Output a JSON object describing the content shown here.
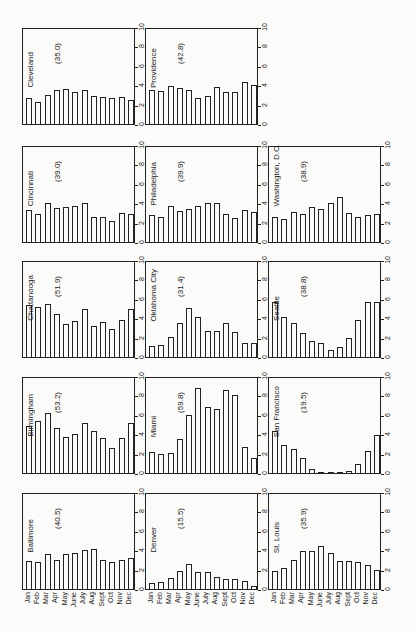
{
  "chart_data": {
    "type": "bar",
    "categories": [
      "Jan",
      "Feb",
      "Mar",
      "Apr",
      "May",
      "June",
      "July",
      "Aug",
      "Sept",
      "Oct",
      "Nov",
      "Dec"
    ],
    "ylim": [
      0,
      10
    ],
    "yticks": [
      0,
      2,
      4,
      6,
      8,
      10
    ],
    "grid": false,
    "layout": "3 columns x 5 rows small multiples; month labels only under bottom row",
    "panels": [
      {
        "city": "Cleveland",
        "total": "(35.0)",
        "row": 0,
        "col": 0,
        "values": [
          2.7,
          2.3,
          3.1,
          3.6,
          3.7,
          3.4,
          3.6,
          3.0,
          2.8,
          2.7,
          2.8,
          2.5
        ]
      },
      {
        "city": "Providence",
        "total": "(42.8)",
        "row": 0,
        "col": 1,
        "values": [
          3.6,
          3.5,
          4.0,
          3.8,
          3.6,
          2.7,
          2.9,
          3.9,
          3.4,
          3.4,
          4.4,
          4.1
        ]
      },
      {
        "city": "Cincinnati",
        "total": "(39.0)",
        "row": 1,
        "col": 0,
        "values": [
          3.4,
          3.0,
          4.1,
          3.6,
          3.7,
          3.8,
          4.1,
          2.6,
          2.6,
          2.2,
          3.1,
          2.9
        ]
      },
      {
        "city": "Philadelphia",
        "total": "(39.9)",
        "row": 1,
        "col": 1,
        "values": [
          2.8,
          2.6,
          3.8,
          3.3,
          3.5,
          3.8,
          4.1,
          4.1,
          3.0,
          2.5,
          3.4,
          3.2
        ]
      },
      {
        "city": "Washington, D.C.",
        "total": "(38.9)",
        "row": 1,
        "col": 2,
        "values": [
          2.6,
          2.4,
          3.2,
          2.9,
          3.7,
          3.5,
          4.1,
          4.7,
          3.1,
          2.6,
          2.8,
          2.9
        ]
      },
      {
        "city": "Chattanooga",
        "total": "(51.9)",
        "row": 2,
        "col": 0,
        "values": [
          5.5,
          5.3,
          5.6,
          4.5,
          3.5,
          3.8,
          5.1,
          3.3,
          3.7,
          3.0,
          3.9,
          5.1
        ]
      },
      {
        "city": "Oklahoma City",
        "total": "(31.4)",
        "row": 2,
        "col": 1,
        "values": [
          1.2,
          1.3,
          2.1,
          3.6,
          5.2,
          4.2,
          2.7,
          2.7,
          3.6,
          2.6,
          1.5,
          1.5
        ]
      },
      {
        "city": "Seattle",
        "total": "(38.8)",
        "row": 2,
        "col": 2,
        "values": [
          5.8,
          4.2,
          3.6,
          2.5,
          1.7,
          1.5,
          0.7,
          1.1,
          2.0,
          3.9,
          5.8,
          5.8
        ]
      },
      {
        "city": "Birmingham",
        "total": "(53.2)",
        "row": 3,
        "col": 0,
        "values": [
          5.0,
          5.5,
          6.3,
          4.7,
          3.8,
          4.1,
          5.3,
          4.4,
          3.7,
          2.6,
          3.7,
          5.3
        ]
      },
      {
        "city": "Miami",
        "total": "(59.8)",
        "row": 3,
        "col": 1,
        "values": [
          2.2,
          2.0,
          2.1,
          3.6,
          6.1,
          9.0,
          6.9,
          6.7,
          8.7,
          8.2,
          2.7,
          1.6
        ]
      },
      {
        "city": "San Francisco",
        "total": "(19.5)",
        "row": 3,
        "col": 2,
        "values": [
          4.4,
          3.0,
          2.5,
          1.6,
          0.4,
          0.1,
          0.0,
          0.0,
          0.2,
          1.0,
          2.3,
          4.0
        ]
      },
      {
        "city": "Baltimore",
        "total": "(40.5)",
        "row": 4,
        "col": 0,
        "values": [
          2.9,
          2.8,
          3.7,
          3.1,
          3.7,
          3.8,
          4.1,
          4.2,
          3.1,
          2.8,
          3.1,
          3.3
        ]
      },
      {
        "city": "Denver",
        "total": "(15.5)",
        "row": 4,
        "col": 1,
        "values": [
          0.6,
          0.7,
          1.2,
          1.9,
          2.6,
          1.8,
          1.8,
          1.3,
          1.1,
          1.1,
          0.8,
          0.3
        ]
      },
      {
        "city": "St. Louis",
        "total": "(35.9)",
        "row": 4,
        "col": 2,
        "values": [
          1.9,
          2.2,
          3.1,
          4.0,
          4.0,
          4.5,
          3.8,
          2.9,
          2.9,
          2.8,
          2.5,
          2.0
        ]
      }
    ]
  },
  "colors": {
    "ink": "#222222",
    "paper": "#fbfbf9"
  }
}
